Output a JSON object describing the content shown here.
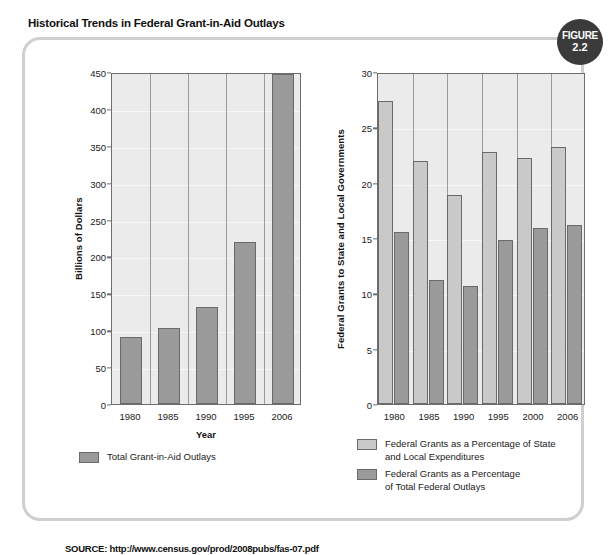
{
  "figure": {
    "title": "Historical Trends in Federal Grant-in-Aid Outlays",
    "badge_word": "FIGURE",
    "badge_number": "2.2",
    "source": "SOURCE: http://www.census.gov/prod/2008pubs/fas-07.pdf",
    "badge_color": "#3b3b3b",
    "frame_color": "#cfcfcf",
    "plot_bg_color": "#ebebeb",
    "series_light_color": "#c9c9c9",
    "series_dark_color": "#9a9a9a"
  },
  "chart_data": [
    {
      "id": "left",
      "type": "bar",
      "title": "",
      "xlabel": "Year",
      "ylabel": "Billions of Dollars",
      "ylim": [
        0,
        450
      ],
      "ytick_step": 50,
      "yticks": [
        "0",
        "50",
        "100",
        "150",
        "200",
        "250",
        "300",
        "350",
        "400",
        "450"
      ],
      "grid": true,
      "legend_position": "bottom",
      "categories": [
        "1980",
        "1985",
        "1990",
        "1995",
        "2006"
      ],
      "series": [
        {
          "name": "Total Grant-in-Aid Outlays",
          "color": "#9a9a9a",
          "values": [
            91,
            103,
            132,
            220,
            447
          ]
        }
      ]
    },
    {
      "id": "right",
      "type": "bar",
      "title": "",
      "xlabel": "",
      "ylabel": "Federal Grants to State and Local Governments",
      "ylim": [
        0,
        30
      ],
      "ytick_step": 5,
      "yticks": [
        "0",
        "5",
        "10",
        "15",
        "20",
        "25",
        "30"
      ],
      "grid": true,
      "legend_position": "bottom",
      "categories": [
        "1980",
        "1985",
        "1990",
        "1995",
        "2000",
        "2006"
      ],
      "series": [
        {
          "name": "Federal Grants as a Percentage of State and Local Expenditures",
          "name_line1": "Federal Grants as a Percentage of State",
          "name_line2": "and Local Expenditures",
          "color": "#c9c9c9",
          "values": [
            27.4,
            22.0,
            18.9,
            22.8,
            22.2,
            23.2
          ]
        },
        {
          "name": "Federal Grants as a Percentage of Total Federal Outlays",
          "name_line1": "Federal Grants as a Percentage",
          "name_line2": "of Total Federal Outlays",
          "color": "#9a9a9a",
          "values": [
            15.5,
            11.2,
            10.7,
            14.8,
            15.9,
            16.2
          ]
        }
      ]
    }
  ]
}
